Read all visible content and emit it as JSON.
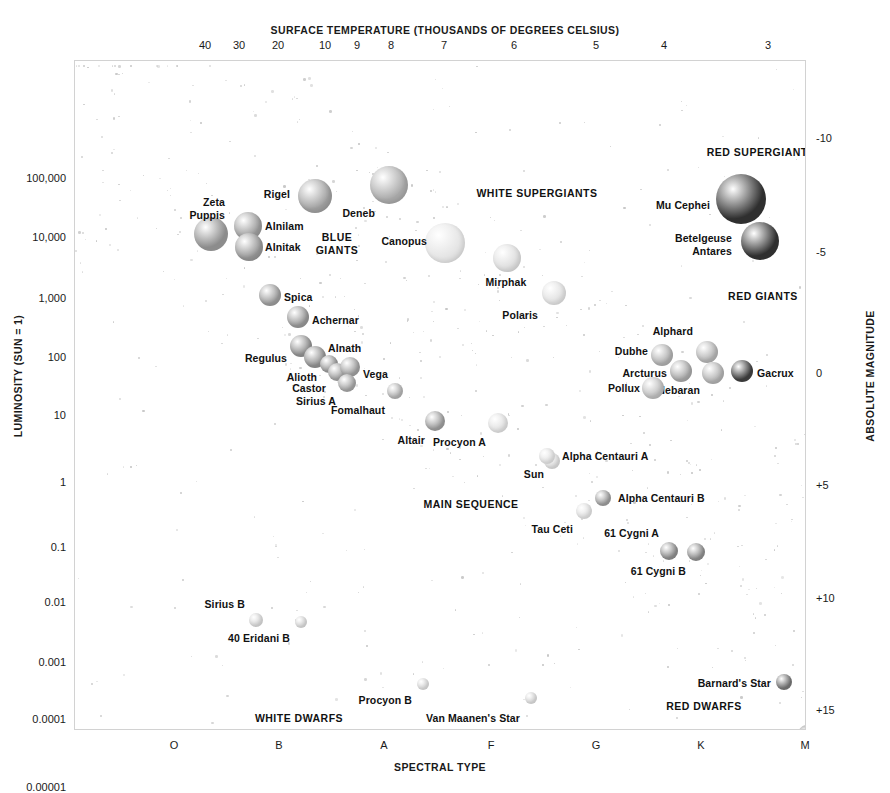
{
  "chart_data": {
    "type": "scatter",
    "top_axis_label": "SURFACE TEMPERATURE (THOUSANDS OF DEGREES CELSIUS)",
    "bottom_axis_label": "SPECTRAL TYPE",
    "left_axis_label": "LUMINOSITY (SUN = 1)",
    "right_axis_label": "ABSOLUTE MAGNITUDE",
    "grid": false,
    "legend": "none",
    "top_ticks": [
      {
        "label": "40",
        "x": 131
      },
      {
        "label": "30",
        "x": 165
      },
      {
        "label": "20",
        "x": 204
      },
      {
        "label": "10",
        "x": 251
      },
      {
        "label": "9",
        "x": 283
      },
      {
        "label": "8",
        "x": 317
      },
      {
        "label": "7",
        "x": 370
      },
      {
        "label": "6",
        "x": 440
      },
      {
        "label": "5",
        "x": 522
      },
      {
        "label": "4",
        "x": 590
      },
      {
        "label": "3",
        "x": 694
      }
    ],
    "bottom_ticks": [
      {
        "label": "O",
        "x": 100
      },
      {
        "label": "B",
        "x": 205
      },
      {
        "label": "A",
        "x": 310
      },
      {
        "label": "F",
        "x": 417
      },
      {
        "label": "G",
        "x": 522
      },
      {
        "label": "K",
        "x": 627
      },
      {
        "label": "M",
        "x": 731
      }
    ],
    "left_ticks": [
      {
        "label": "100,000",
        "y": 118
      },
      {
        "label": "10,000",
        "y": 177
      },
      {
        "label": "1,000",
        "y": 238
      },
      {
        "label": "100",
        "y": 297
      },
      {
        "label": "10",
        "y": 355
      },
      {
        "label": "1",
        "y": 422
      },
      {
        "label": "0.1",
        "y": 487
      },
      {
        "label": "0.01",
        "y": 542
      },
      {
        "label": "0.001",
        "y": 602
      },
      {
        "label": "0.0001",
        "y": 659
      },
      {
        "label": "0.00001",
        "y": 727
      }
    ],
    "right_ticks": [
      {
        "label": "-10",
        "y": 78
      },
      {
        "label": "-5",
        "y": 192
      },
      {
        "label": "0",
        "y": 313
      },
      {
        "label": "+5",
        "y": 425
      },
      {
        "label": "+10",
        "y": 538
      },
      {
        "label": "+15",
        "y": 650
      }
    ],
    "region_labels": [
      {
        "name": "blue-giants",
        "text": "BLUE\nGIANTS",
        "x": 262,
        "y": 183
      },
      {
        "name": "white-supergiants",
        "text": "WHITE SUPERGIANTS",
        "x": 462,
        "y": 133
      },
      {
        "name": "red-supergiants",
        "text": "RED SUPERGIANTS",
        "x": 686,
        "y": 92
      },
      {
        "name": "red-giants",
        "text": "RED GIANTS",
        "x": 688,
        "y": 236
      },
      {
        "name": "main-sequence",
        "text": "MAIN SEQUENCE",
        "x": 396,
        "y": 444
      },
      {
        "name": "white-dwarfs",
        "text": "WHITE DWARFS",
        "x": 224,
        "y": 658
      },
      {
        "name": "red-dwarfs",
        "text": "RED DWARFS",
        "x": 629,
        "y": 646
      }
    ],
    "stars": [
      {
        "name": "Zeta Puppis",
        "x": 136,
        "y": 173,
        "r": 17,
        "color": "#8c8c8c",
        "label": "Zeta\nPuppis",
        "lx": 150,
        "ly": 148,
        "align": "left",
        "lum": 360000,
        "mag": -6.0,
        "spectral": "O"
      },
      {
        "name": "Rigel",
        "x": 240,
        "y": 135,
        "r": 17,
        "color": "#9e9e9e",
        "label": "Rigel",
        "lx": 215,
        "ly": 133,
        "align": "left",
        "lum": 66000,
        "mag": -7.0,
        "spectral": "B"
      },
      {
        "name": "Alnilam",
        "x": 173,
        "y": 165,
        "r": 14,
        "color": "#9a9a9a",
        "label": "Alnilam",
        "lx": 190,
        "ly": 165,
        "align": "right",
        "lum": 27000,
        "mag": -6.4,
        "spectral": "B"
      },
      {
        "name": "Alnitak",
        "x": 174,
        "y": 186,
        "r": 14,
        "color": "#959595",
        "label": "Alnitak",
        "lx": 190,
        "ly": 186,
        "align": "right",
        "lum": 20000,
        "mag": -5.3,
        "spectral": "O"
      },
      {
        "name": "Deneb",
        "x": 314,
        "y": 124,
        "r": 19,
        "color": "#a8a8a8",
        "label": "Deneb",
        "lx": 300,
        "ly": 152,
        "align": "left",
        "lum": 100000,
        "mag": -7.2,
        "spectral": "A"
      },
      {
        "name": "Canopus",
        "x": 370,
        "y": 182,
        "r": 20,
        "color": "#e3e3e3",
        "label": "Canopus",
        "lx": 352,
        "ly": 180,
        "align": "left",
        "lum": 10000,
        "mag": -5.5,
        "spectral": "F"
      },
      {
        "name": "Mirphak",
        "x": 432,
        "y": 197,
        "r": 14,
        "color": "#dcdcdc",
        "label": "Mirphak",
        "lx": 431,
        "ly": 221,
        "align": "center",
        "lum": 5000,
        "mag": -4.5,
        "spectral": "F"
      },
      {
        "name": "Polaris",
        "x": 479,
        "y": 232,
        "r": 12,
        "color": "#e0e0e0",
        "label": "Polaris",
        "lx": 463,
        "ly": 254,
        "align": "left",
        "lum": 2500,
        "mag": -3.6,
        "spectral": "F"
      },
      {
        "name": "Spica",
        "x": 195,
        "y": 234,
        "r": 11,
        "color": "#9a9a9a",
        "label": "Spica",
        "lx": 209,
        "ly": 236,
        "align": "right",
        "lum": 2000,
        "mag": -3.5,
        "spectral": "B"
      },
      {
        "name": "Achernar",
        "x": 223,
        "y": 256,
        "r": 11,
        "color": "#969696",
        "label": "Achernar",
        "lx": 237,
        "ly": 259,
        "align": "right",
        "lum": 1000,
        "mag": -2.8,
        "spectral": "B"
      },
      {
        "name": "Regulus",
        "x": 226,
        "y": 285,
        "r": 11,
        "color": "#8f8f8f",
        "label": "Regulus",
        "lx": 212,
        "ly": 297,
        "align": "left",
        "lum": 150,
        "mag": -0.5,
        "spectral": "B"
      },
      {
        "name": "Alnath",
        "x": 240,
        "y": 296,
        "r": 11,
        "color": "#8f8f8f",
        "label": "Alnath",
        "lx": 253,
        "ly": 287,
        "align": "right",
        "lum": 700,
        "mag": -1.4,
        "spectral": "B"
      },
      {
        "name": "Alioth",
        "x": 254,
        "y": 303,
        "r": 9,
        "color": "#979797",
        "label": "Alioth",
        "lx": 242,
        "ly": 316,
        "align": "left",
        "lum": 100,
        "mag": 0.2,
        "spectral": "A"
      },
      {
        "name": "Castor",
        "x": 262,
        "y": 311,
        "r": 9,
        "color": "#a0a0a0",
        "label": "Castor",
        "lx": 251,
        "ly": 327,
        "align": "left",
        "lum": 40,
        "mag": 0.6,
        "spectral": "A"
      },
      {
        "name": "Vega",
        "x": 275,
        "y": 306,
        "r": 10,
        "color": "#9e9e9e",
        "label": "Vega",
        "lx": 288,
        "ly": 313,
        "align": "right",
        "lum": 50,
        "mag": 0.6,
        "spectral": "A"
      },
      {
        "name": "Sirius A",
        "x": 272,
        "y": 322,
        "r": 9,
        "color": "#a4a4a4",
        "label": "Sirius A",
        "lx": 261,
        "ly": 340,
        "align": "left",
        "lum": 25,
        "mag": 1.4,
        "spectral": "A"
      },
      {
        "name": "Fomalhaut",
        "x": 320,
        "y": 330,
        "r": 8,
        "color": "#b2b2b2",
        "label": "Fomalhaut",
        "lx": 310,
        "ly": 349,
        "align": "left",
        "lum": 16,
        "mag": 1.7,
        "spectral": "A"
      },
      {
        "name": "Altair",
        "x": 360,
        "y": 360,
        "r": 10,
        "color": "#9c9c9c",
        "label": "Altair",
        "lx": 350,
        "ly": 379,
        "align": "left",
        "lum": 10,
        "mag": 2.2,
        "spectral": "A"
      },
      {
        "name": "Procyon A",
        "x": 423,
        "y": 362,
        "r": 10,
        "color": "#e0e0e0",
        "label": "Procyon A",
        "lx": 411,
        "ly": 381,
        "align": "left",
        "lum": 7,
        "mag": 2.7,
        "spectral": "F"
      },
      {
        "name": "Sun",
        "x": 477,
        "y": 400,
        "r": 8,
        "color": "#dcdcdc",
        "label": "Sun",
        "lx": 469,
        "ly": 413,
        "align": "left",
        "lum": 1,
        "mag": 4.8,
        "spectral": "G"
      },
      {
        "name": "Alpha Centauri A",
        "x": 472,
        "y": 395,
        "r": 8,
        "color": "#e2e2e2",
        "label": "Alpha Centauri A",
        "lx": 487,
        "ly": 395,
        "align": "right",
        "lum": 1.5,
        "mag": 4.4,
        "spectral": "G"
      },
      {
        "name": "Alpha Centauri B",
        "x": 528,
        "y": 437,
        "r": 8,
        "color": "#9c9c9c",
        "label": "Alpha Centauri B",
        "lx": 543,
        "ly": 437,
        "align": "right",
        "lum": 0.5,
        "mag": 5.7,
        "spectral": "K"
      },
      {
        "name": "Tau Ceti",
        "x": 509,
        "y": 450,
        "r": 8,
        "color": "#e1e1e1",
        "label": "Tau Ceti",
        "lx": 498,
        "ly": 468,
        "align": "left",
        "lum": 0.45,
        "mag": 5.7,
        "spectral": "G"
      },
      {
        "name": "61 Cygni A",
        "x": 594,
        "y": 490,
        "r": 9,
        "color": "#8d8d8d",
        "label": "61 Cygni A",
        "lx": 584,
        "ly": 472,
        "align": "left",
        "lum": 0.085,
        "mag": 7.5,
        "spectral": "K"
      },
      {
        "name": "61 Cygni B",
        "x": 621,
        "y": 491,
        "r": 9,
        "color": "#8d8d8d",
        "label": "61 Cygni B",
        "lx": 611,
        "ly": 510,
        "align": "left",
        "lum": 0.08,
        "mag": 8.3,
        "spectral": "K"
      },
      {
        "name": "Dubhe",
        "x": 587,
        "y": 294,
        "r": 11,
        "color": "#aeaeae",
        "label": "Dubhe",
        "lx": 573,
        "ly": 290,
        "align": "left",
        "lum": 200,
        "mag": -0.2,
        "spectral": "K"
      },
      {
        "name": "Arcturus",
        "x": 606,
        "y": 310,
        "r": 11,
        "color": "#a6a6a6",
        "label": "Arcturus",
        "lx": 592,
        "ly": 312,
        "align": "left",
        "lum": 160,
        "mag": -0.3,
        "spectral": "K"
      },
      {
        "name": "Alphard",
        "x": 632,
        "y": 291,
        "r": 11,
        "color": "#b3b3b3",
        "label": "Alphard",
        "lx": 618,
        "ly": 270,
        "align": "left",
        "lum": 400,
        "mag": -1.7,
        "spectral": "K"
      },
      {
        "name": "Aldebaran",
        "x": 638,
        "y": 312,
        "r": 11,
        "color": "#b0b0b0",
        "label": "Aldebaran",
        "lx": 625,
        "ly": 329,
        "align": "left",
        "lum": 150,
        "mag": -0.6,
        "spectral": "K"
      },
      {
        "name": "Pollux",
        "x": 578,
        "y": 327,
        "r": 11,
        "color": "#bcbcbc",
        "label": "Pollux",
        "lx": 565,
        "ly": 327,
        "align": "left",
        "lum": 35,
        "mag": 1.1,
        "spectral": "K"
      },
      {
        "name": "Gacrux",
        "x": 667,
        "y": 310,
        "r": 11,
        "color": "#3a3a3a",
        "label": "Gacrux",
        "lx": 682,
        "ly": 312,
        "align": "right",
        "lum": 820,
        "mag": -0.6,
        "spectral": "M"
      },
      {
        "name": "Mu Cephei",
        "x": 666,
        "y": 138,
        "r": 25,
        "color": "#2f2f2f",
        "label": "Mu Cephei",
        "lx": 635,
        "ly": 144,
        "align": "left",
        "lum": 60000,
        "mag": -7.6,
        "spectral": "M"
      },
      {
        "name": "Betelgeuse",
        "x": 685,
        "y": 180,
        "r": 19,
        "color": "#2f2f2f",
        "label": "Betelgeuse",
        "lx": 657,
        "ly": 177,
        "align": "left",
        "lum": 14000,
        "mag": -5.8,
        "spectral": "M"
      },
      {
        "name": "Antares",
        "x": 685,
        "y": 180,
        "r": 0,
        "color": "#2f2f2f",
        "label": "Antares",
        "lx": 657,
        "ly": 190,
        "align": "left",
        "lum": 10000,
        "mag": -5.3,
        "spectral": "M"
      },
      {
        "name": "Sirius B",
        "x": 181,
        "y": 559,
        "r": 7,
        "color": "#d8d8d8",
        "label": "Sirius B",
        "lx": 170,
        "ly": 543,
        "align": "left",
        "lum": 0.0028,
        "mag": 11.2,
        "spectral": "A"
      },
      {
        "name": "40 Eridani B",
        "x": 226,
        "y": 561,
        "r": 6,
        "color": "#dadada",
        "label": "40 Eridani B",
        "lx": 215,
        "ly": 577,
        "align": "left",
        "lum": 0.0053,
        "mag": 11.0,
        "spectral": "A"
      },
      {
        "name": "Procyon B",
        "x": 348,
        "y": 623,
        "r": 6,
        "color": "#dcdcdc",
        "label": "Procyon B",
        "lx": 337,
        "ly": 639,
        "align": "left",
        "lum": 0.0006,
        "mag": 13.2,
        "spectral": "F"
      },
      {
        "name": "Van Maanen's Star",
        "x": 456,
        "y": 637,
        "r": 6,
        "color": "#dcdcdc",
        "label": "Van Maanen's Star",
        "lx": 445,
        "ly": 657,
        "align": "left",
        "lum": 0.00017,
        "mag": 14.2,
        "spectral": "F"
      },
      {
        "name": "Barnard's Star",
        "x": 709,
        "y": 621,
        "r": 8,
        "color": "#6a6a6a",
        "label": "Barnard's Star",
        "lx": 696,
        "ly": 622,
        "align": "left",
        "lum": 0.0004,
        "mag": 13.2,
        "spectral": "M"
      },
      {
        "name": "Proxima Centauri",
        "x": 732,
        "y": 673,
        "r": 9,
        "color": "#6e6e6e",
        "label": "Proxima Centauri",
        "lx": 719,
        "ly": 675,
        "align": "left",
        "lum": 0.00017,
        "mag": 15.5,
        "spectral": "M"
      }
    ]
  }
}
